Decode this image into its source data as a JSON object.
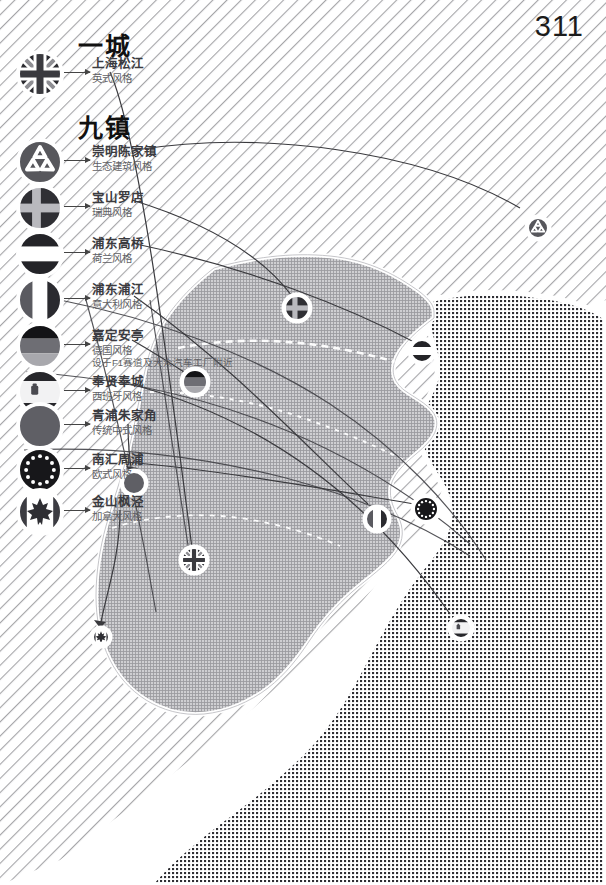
{
  "page": {
    "number": "311",
    "headings": {
      "city": "一城",
      "towns": "九镇"
    }
  },
  "legend": {
    "city_item": {
      "icon": "union-jack-flag-icon",
      "name": "上海松江",
      "style": "英式风格",
      "note": ""
    },
    "town_items": [
      {
        "icon": "recycle-eco-icon",
        "name": "崇明陈家镇",
        "style": "生态建筑风格",
        "note": ""
      },
      {
        "icon": "sweden-flag-icon",
        "name": "宝山罗店",
        "style": "瑞典风格",
        "note": ""
      },
      {
        "icon": "netherlands-flag-icon",
        "name": "浦东高桥",
        "style": "荷兰风格",
        "note": ""
      },
      {
        "icon": "italy-flag-icon",
        "name": "浦东浦江",
        "style": "意大利风格",
        "note": ""
      },
      {
        "icon": "germany-flag-icon",
        "name": "嘉定安亭",
        "style": "德国风格",
        "note": "设于F1赛道及大众汽车工厂附近"
      },
      {
        "icon": "spain-flag-icon",
        "name": "奉贤奉城",
        "style": "西班牙风格",
        "note": ""
      },
      {
        "icon": "chinese-traditional-icon",
        "name": "青浦朱家角",
        "style": "传统中式风格",
        "note": ""
      },
      {
        "icon": "europe-stars-icon",
        "name": "南汇周浦",
        "style": "欧式风格",
        "note": ""
      },
      {
        "icon": "canada-maple-leaf-icon",
        "name": "金山枫泾",
        "style": "加拿大风格",
        "note": ""
      }
    ]
  },
  "map": {
    "name": "shanghai-map",
    "markers": [
      {
        "id": "marker-chongming",
        "icon": "recycle-eco-icon",
        "x": 538,
        "y": 228,
        "r": 11
      },
      {
        "id": "marker-baoshan",
        "icon": "sweden-flag-icon",
        "x": 297,
        "y": 308,
        "r": 13
      },
      {
        "id": "marker-gaoqiao",
        "icon": "netherlands-flag-icon",
        "x": 422,
        "y": 351,
        "r": 12
      },
      {
        "id": "marker-anting",
        "icon": "germany-flag-icon",
        "x": 195,
        "y": 382,
        "r": 13
      },
      {
        "id": "marker-zhujiajiao",
        "icon": "chinese-traditional-icon",
        "x": 134,
        "y": 483,
        "r": 12
      },
      {
        "id": "marker-pujiang",
        "icon": "italy-flag-icon",
        "x": 377,
        "y": 519,
        "r": 12
      },
      {
        "id": "marker-zhoupu",
        "icon": "europe-stars-icon",
        "x": 426,
        "y": 509,
        "r": 13
      },
      {
        "id": "marker-songjiang",
        "icon": "union-jack-flag-icon",
        "x": 194,
        "y": 560,
        "r": 13
      },
      {
        "id": "marker-fengcheng",
        "icon": "spain-flag-icon",
        "x": 461,
        "y": 628,
        "r": 11
      },
      {
        "id": "marker-fengjing",
        "icon": "canada-maple-leaf-icon",
        "x": 101,
        "y": 637,
        "r": 9
      }
    ]
  },
  "colors": {
    "ink": "#1b1b1b",
    "text_gray": "#5f5f64",
    "land_fill": "#a9a9ad",
    "water_dots": "#3b3b3f",
    "hatch": "#5a5a5f",
    "line": "#3a3a3e"
  }
}
